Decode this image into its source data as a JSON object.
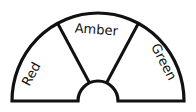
{
  "diagram": {
    "type": "semicircle-gauge",
    "segments": [
      {
        "label": "Red"
      },
      {
        "label": "Amber"
      },
      {
        "label": "Green"
      }
    ],
    "stroke_color": "#111111",
    "fill_color": "#ffffff"
  }
}
